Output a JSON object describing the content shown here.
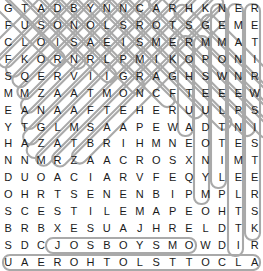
{
  "puzzle": {
    "type": "word-search",
    "rows": 16,
    "cols": 16,
    "grid": [
      [
        "G",
        "T",
        "A",
        "D",
        "B",
        "Y",
        "N",
        "N",
        "C",
        "A",
        "R",
        "H",
        "K",
        "N",
        "E",
        "R"
      ],
      [
        "F",
        "U",
        "S",
        "O",
        "N",
        "O",
        "L",
        "S",
        "R",
        "O",
        "T",
        "S",
        "G",
        "E",
        "M",
        "E"
      ],
      [
        "C",
        "L",
        "O",
        "I",
        "S",
        "A",
        "E",
        "I",
        "S",
        "M",
        "E",
        "R",
        "M",
        "M",
        "A",
        "T"
      ],
      [
        "F",
        "K",
        "O",
        "R",
        "N",
        "R",
        "L",
        "P",
        "M",
        "I",
        "K",
        "O",
        "P",
        "O",
        "N",
        "I"
      ],
      [
        "S",
        "Q",
        "E",
        "R",
        "V",
        "I",
        "I",
        "G",
        "R",
        "A",
        "G",
        "H",
        "S",
        "W",
        "N",
        "R"
      ],
      [
        "M",
        "M",
        "Z",
        "A",
        "A",
        "T",
        "M",
        "O",
        "N",
        "C",
        "F",
        "T",
        "E",
        "E",
        "E",
        "W"
      ],
      [
        "E",
        "A",
        "N",
        "A",
        "A",
        "F",
        "T",
        "E",
        "H",
        "E",
        "R",
        "U",
        "U",
        "L",
        "P",
        "S"
      ],
      [
        "Y",
        "T",
        "G",
        "L",
        "M",
        "S",
        "A",
        "A",
        "P",
        "E",
        "W",
        "A",
        "D",
        "T",
        "N",
        "I"
      ],
      [
        "H",
        "A",
        "Z",
        "A",
        "T",
        "B",
        "R",
        "I",
        "H",
        "M",
        "N",
        "E",
        "O",
        "T",
        "E",
        "S"
      ],
      [
        "N",
        "N",
        "M",
        "R",
        "Z",
        "A",
        "A",
        "C",
        "R",
        "O",
        "S",
        "X",
        "N",
        "I",
        "M",
        "T"
      ],
      [
        "D",
        "U",
        "O",
        "A",
        "C",
        "I",
        "A",
        "R",
        "V",
        "F",
        "E",
        "Q",
        "Y",
        "L",
        "E",
        "E"
      ],
      [
        "O",
        "H",
        "R",
        "T",
        "S",
        "E",
        "N",
        "E",
        "N",
        "B",
        "I",
        "P",
        "M",
        "P",
        "L",
        "R"
      ],
      [
        "S",
        "C",
        "E",
        "S",
        "T",
        "I",
        "L",
        "E",
        "M",
        "A",
        "P",
        "E",
        "O",
        "H",
        "T",
        "S"
      ],
      [
        "B",
        "R",
        "B",
        "X",
        "E",
        "S",
        "U",
        "A",
        "J",
        "H",
        "R",
        "E",
        "L",
        "D",
        "T",
        "K"
      ],
      [
        "S",
        "D",
        "C",
        "J",
        "O",
        "S",
        "B",
        "O",
        "Y",
        "S",
        "M",
        "O",
        "W",
        "D",
        "I",
        "R"
      ],
      [
        "U",
        "A",
        "E",
        "R",
        "O",
        "H",
        "T",
        "O",
        "L",
        "S",
        "T",
        "T",
        "O",
        "C",
        "L",
        "A"
      ]
    ],
    "colors": {
      "letter": "#1a1a1a",
      "background": "#ffffff",
      "highlight_stroke": "#a8a8a8"
    },
    "highlights": [
      {
        "name": "vertical-band-col-13",
        "orientation": "vertical",
        "col": 13,
        "row_start": 0,
        "row_end": 10
      },
      {
        "name": "vertical-band-col-14",
        "orientation": "vertical",
        "col": 14,
        "row_start": 0,
        "row_end": 14
      },
      {
        "name": "vertical-band-col-15",
        "orientation": "vertical",
        "col": 15,
        "row_start": 0,
        "row_end": 13
      },
      {
        "name": "vertical-band-col-12",
        "orientation": "vertical",
        "col": 12,
        "row_start": 2,
        "row_end": 11
      },
      {
        "name": "vertical-band-col-11",
        "orientation": "vertical",
        "col": 11,
        "row_start": 2,
        "row_end": 7
      },
      {
        "name": "horizontal-band-row-15",
        "orientation": "horizontal",
        "row": 15,
        "col_start": 0,
        "col_end": 15
      },
      {
        "name": "horizontal-band-row-14",
        "orientation": "horizontal",
        "row": 14,
        "col_start": 3,
        "col_end": 11
      }
    ]
  }
}
